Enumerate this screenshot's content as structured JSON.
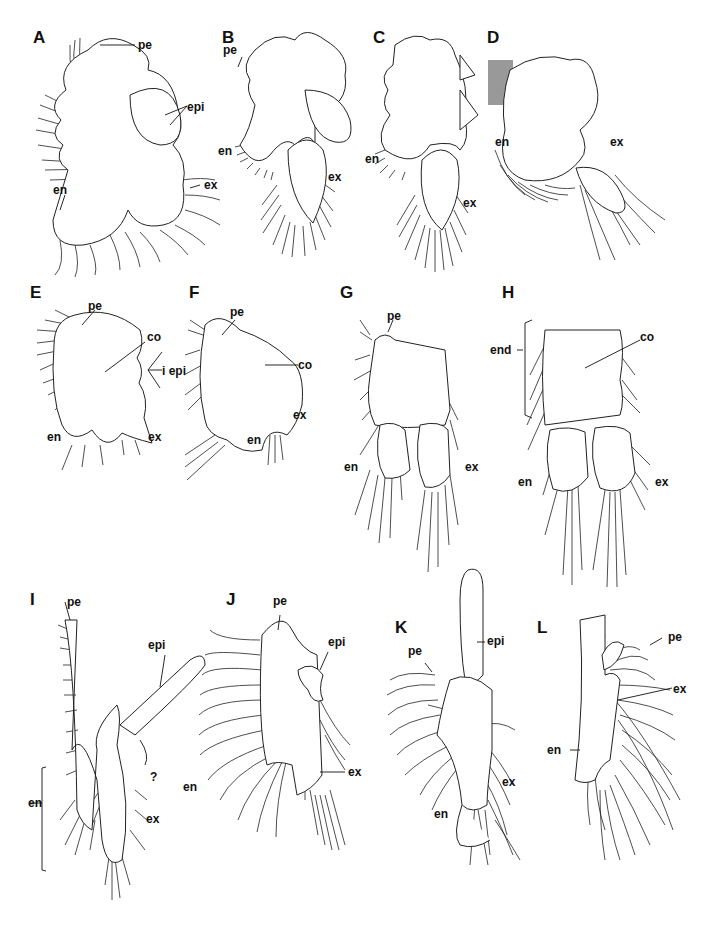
{
  "figure": {
    "type": "multi-panel scientific line drawing of crustacean thoracic limbs",
    "background": "#ffffff",
    "ink": "#111111"
  },
  "panels": [
    {
      "letter": "A",
      "labels": {
        "pe": "pe",
        "epi": "epi",
        "en": "en",
        "ex": "ex"
      }
    },
    {
      "letter": "B",
      "labels": {
        "pe": "pe",
        "en": "en",
        "ex": "ex"
      }
    },
    {
      "letter": "C",
      "labels": {
        "en": "en",
        "ex": "ex"
      }
    },
    {
      "letter": "D",
      "labels": {
        "en": "en",
        "ex": "ex"
      }
    },
    {
      "letter": "E",
      "labels": {
        "pe": "pe",
        "co": "co",
        "epi": "i epi",
        "en": "en",
        "ex": "ex"
      }
    },
    {
      "letter": "F",
      "labels": {
        "pe": "pe",
        "co": "co",
        "en": "en",
        "ex": "ex"
      }
    },
    {
      "letter": "G",
      "labels": {
        "pe": "pe",
        "en": "en",
        "ex": "ex"
      }
    },
    {
      "letter": "H",
      "labels": {
        "end": "end",
        "co": "co",
        "en": "en",
        "ex": "ex"
      }
    },
    {
      "letter": "I",
      "labels": {
        "pe": "pe",
        "epi": "epi",
        "q": "?",
        "en": "en",
        "ex": "ex"
      }
    },
    {
      "letter": "J",
      "labels": {
        "pe": "pe",
        "epi": "epi",
        "en": "en",
        "ex": "ex"
      }
    },
    {
      "letter": "K",
      "labels": {
        "pe": "pe",
        "epi": "epi",
        "en": "en",
        "ex": "ex"
      }
    },
    {
      "letter": "L",
      "labels": {
        "pe": "pe",
        "ex": "ex",
        "en": "en"
      }
    }
  ],
  "abbreviations": [
    "pe",
    "epi",
    "en",
    "ex",
    "co",
    "end",
    "i epi",
    "?"
  ]
}
